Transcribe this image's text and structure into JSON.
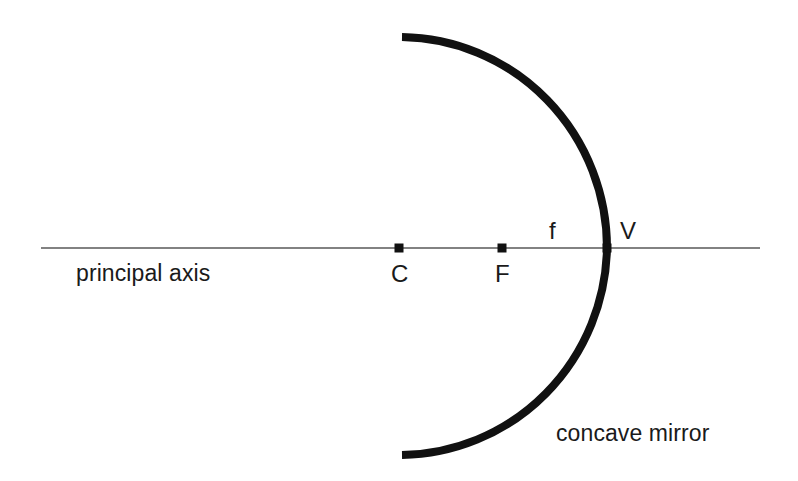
{
  "canvas": {
    "width": 798,
    "height": 481,
    "background": "#ffffff",
    "ink_color": "#111111",
    "axis_color": "#585858"
  },
  "diagram": {
    "type": "concave-mirror-ray-diagram",
    "principal_axis": {
      "label": "principal axis",
      "x_start": 41,
      "x_end": 760,
      "y": 248,
      "stroke_width": 1.6,
      "color": "#585858",
      "label_x": 76,
      "label_y": 262
    },
    "mirror": {
      "label": "concave mirror",
      "stroke_width": 8,
      "color": "#111111",
      "vertex_x": 607,
      "vertex_y": 248,
      "top_end_x": 402,
      "top_end_y": 37,
      "bottom_end_x": 402,
      "bottom_end_y": 455,
      "radius_x": 208,
      "radius_y": 211,
      "label_x": 556,
      "label_y": 422
    },
    "points": [
      {
        "id": "center-of-curvature",
        "label": "C",
        "x": 399,
        "y": 248,
        "marker": "square",
        "marker_size": 9,
        "label_x": 391,
        "label_y": 262,
        "label_position": "below"
      },
      {
        "id": "focal-point",
        "label": "F",
        "x": 502,
        "y": 248,
        "marker": "square",
        "marker_size": 9,
        "label_x": 495,
        "label_y": 262,
        "label_position": "below"
      },
      {
        "id": "vertex",
        "label": "V",
        "x": 607,
        "y": 248,
        "marker": "square",
        "marker_size": 9,
        "label_x": 620,
        "label_y": 219,
        "label_position": "above-right"
      }
    ],
    "annotations": [
      {
        "id": "focal-length",
        "label": "f",
        "x": 549,
        "y": 219,
        "description": "focal length between F and V"
      }
    ]
  }
}
